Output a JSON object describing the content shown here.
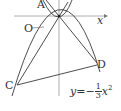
{
  "diagram": {
    "labels": {
      "A": "A",
      "O": "O",
      "x_axis": "x",
      "C": "C",
      "D": "D"
    },
    "equation": {
      "lhs": "y",
      "eq": "=",
      "sign": "−",
      "numerator": "1",
      "denominator": "3",
      "var": "x",
      "exp": "2"
    },
    "colors": {
      "stroke": "#3a3a3a",
      "axis": "#9a9a9a",
      "text": "#333333"
    }
  }
}
